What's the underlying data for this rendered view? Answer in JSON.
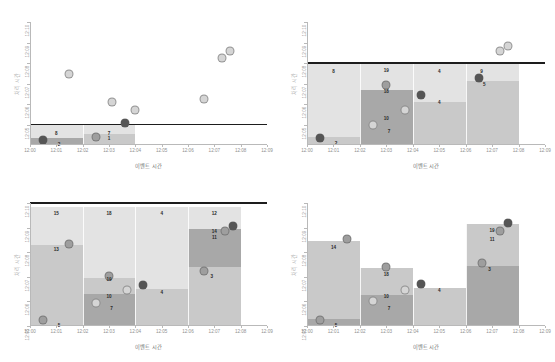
{
  "figure": {
    "panel_count": 4,
    "background": "#ffffff"
  },
  "axes": {
    "xlabel": "이벤트 시간",
    "ylabel": "처리 시간",
    "xticks": [
      "12:00",
      "12:01",
      "12:02",
      "12:03",
      "12:04",
      "12:05",
      "12:06",
      "12:07",
      "12:08",
      "12:09"
    ],
    "yticks": [
      "12:05",
      "12:06",
      "12:07",
      "12:08",
      "12:09",
      "12:10"
    ]
  },
  "colors": {
    "watermark_line": "#1d1d1d",
    "bar_light": "#e3e3e3",
    "bar_mid": "#c9c9c9",
    "bar_dark": "#a8a8a8",
    "marker_dark": "#555555",
    "marker_mid": "#9e9e9e",
    "marker_light": "#d5d5d5",
    "axis": "#b9b9b9",
    "tick_text": "#8f8f8f",
    "axis_label": "#6f6f6f"
  },
  "chart_data": [
    {
      "type": "scatter",
      "id": "panel-top-left",
      "title": "",
      "xlabel": "이벤트 시간",
      "ylabel": "처리 시간",
      "xlim": [
        "12:00",
        "12:09"
      ],
      "ylim": [
        "12:04",
        "12:10"
      ],
      "grid": false,
      "watermark": {
        "label": "watermark",
        "y": "12:05"
      },
      "bars": [
        {
          "x0": "12:00",
          "x1": "12:02",
          "segments": [
            {
              "y0": "12:04.00",
              "y1": "12:04.35",
              "shade": "dark"
            },
            {
              "y0": "12:04.35",
              "y1": "12:05.00",
              "shade": "light"
            }
          ]
        },
        {
          "x0": "12:02",
          "x1": "12:04",
          "segments": [
            {
              "y0": "12:04.00",
              "y1": "12:04.55",
              "shade": "mid"
            },
            {
              "y0": "12:04.55",
              "y1": "12:05.00",
              "shade": "light"
            }
          ]
        }
      ],
      "points": [
        {
          "label": "6",
          "x": "12:00.5",
          "y": "12:04.25",
          "tone": "dark"
        },
        {
          "label": "8",
          "x": "12:01.0",
          "y": "12:04.60",
          "tone": "none"
        },
        {
          "label": "2",
          "x": "12:01.1",
          "y": "12:04.05",
          "tone": "none"
        },
        {
          "label": "7",
          "x": "12:02.5",
          "y": "12:04.40",
          "tone": "mid"
        },
        {
          "label": "7",
          "x": "12:03.0",
          "y": "12:04.60",
          "tone": "none"
        },
        {
          "label": "1",
          "x": "12:03.0",
          "y": "12:04.35",
          "tone": "none"
        },
        {
          "label": "11",
          "x": "12:03.6",
          "y": "12:05.05",
          "tone": "dark"
        },
        {
          "label": "9",
          "x": "12:01.5",
          "y": "12:07.45",
          "tone": "light"
        },
        {
          "label": "10",
          "x": "12:03.1",
          "y": "12:06.10",
          "tone": "light"
        },
        {
          "label": "4",
          "x": "12:04.0",
          "y": "12:05.70",
          "tone": "light"
        },
        {
          "label": "3",
          "x": "12:06.6",
          "y": "12:06.25",
          "tone": "light"
        },
        {
          "label": "12",
          "x": "12:07.3",
          "y": "12:08.25",
          "tone": "light"
        },
        {
          "label": "5",
          "x": "12:07.6",
          "y": "12:08.60",
          "tone": "light"
        }
      ]
    },
    {
      "type": "scatter",
      "id": "panel-top-right",
      "title": "",
      "xlabel": "이벤트 시간",
      "ylabel": "처리 시간",
      "xlim": [
        "12:00",
        "12:09"
      ],
      "ylim": [
        "12:04",
        "12:10"
      ],
      "grid": false,
      "watermark": {
        "label": "watermark",
        "y": "12:08"
      },
      "bars": [
        {
          "x0": "12:00",
          "x1": "12:02",
          "segments": [
            {
              "y0": "12:04.00",
              "y1": "12:04.40",
              "shade": "mid"
            },
            {
              "y0": "12:04.40",
              "y1": "12:08.00",
              "shade": "light"
            }
          ]
        },
        {
          "x0": "12:02",
          "x1": "12:04",
          "segments": [
            {
              "y0": "12:04.00",
              "y1": "12:06.70",
              "shade": "dark"
            },
            {
              "y0": "12:06.70",
              "y1": "12:08.00",
              "shade": "light"
            }
          ]
        },
        {
          "x0": "12:04",
          "x1": "12:06",
          "segments": [
            {
              "y0": "12:04.00",
              "y1": "12:06.10",
              "shade": "mid"
            },
            {
              "y0": "12:06.10",
              "y1": "12:08.00",
              "shade": "light"
            }
          ]
        },
        {
          "x0": "12:06",
          "x1": "12:08",
          "segments": [
            {
              "y0": "12:04.00",
              "y1": "12:07.10",
              "shade": "mid"
            },
            {
              "y0": "12:07.10",
              "y1": "12:08.00",
              "shade": "light"
            }
          ]
        }
      ],
      "points": [
        {
          "label": "6",
          "x": "12:00.5",
          "y": "12:04.35",
          "tone": "dark"
        },
        {
          "label": "8",
          "x": "12:01.0",
          "y": "12:07.60",
          "tone": "none"
        },
        {
          "label": "2",
          "x": "12:01.1",
          "y": "12:04.10",
          "tone": "none"
        },
        {
          "label": "19",
          "x": "12:03.0",
          "y": "12:07.65",
          "tone": "none"
        },
        {
          "label": "16",
          "x": "12:03.0",
          "y": "12:06.95",
          "tone": "mid"
        },
        {
          "label": "18",
          "x": "12:03.0",
          "y": "12:06.65",
          "tone": "none"
        },
        {
          "label": "10",
          "x": "12:03.0",
          "y": "12:05.30",
          "tone": "none"
        },
        {
          "label": "7",
          "x": "12:03.1",
          "y": "12:04.70",
          "tone": "none"
        },
        {
          "label": "13",
          "x": "12:02.5",
          "y": "12:05.00",
          "tone": "light"
        },
        {
          "label": "17",
          "x": "12:03.7",
          "y": "12:05.70",
          "tone": "light"
        },
        {
          "label": "4",
          "x": "12:05.0",
          "y": "12:07.60",
          "tone": "none"
        },
        {
          "label": "14",
          "x": "12:04.3",
          "y": "12:06.45",
          "tone": "dark"
        },
        {
          "label": "4",
          "x": "12:05.0",
          "y": "12:06.10",
          "tone": "none"
        },
        {
          "label": "9",
          "x": "12:06.6",
          "y": "12:07.60",
          "tone": "none"
        },
        {
          "label": "5",
          "x": "12:06.7",
          "y": "12:07.00",
          "tone": "none"
        },
        {
          "label": "15",
          "x": "12:06.5",
          "y": "12:07.25",
          "tone": "dark"
        },
        {
          "label": "12",
          "x": "12:07.3",
          "y": "12:08.60",
          "tone": "light"
        },
        {
          "label": "3",
          "x": "12:07.6",
          "y": "12:08.85",
          "tone": "light"
        }
      ]
    },
    {
      "type": "bar",
      "id": "panel-bottom-left",
      "title": "",
      "xlabel": "이벤트 시간",
      "ylabel": "처리 시간",
      "xlim": [
        "12:00",
        "12:09"
      ],
      "ylim": [
        "12:05",
        "12:10"
      ],
      "grid": false,
      "watermark": {
        "label": "watermark",
        "y": "12:10"
      },
      "bars": [
        {
          "x0": "12:00",
          "x1": "12:02",
          "segments": [
            {
              "y0": "12:05.00",
              "y1": "12:08.30",
              "shade": "mid"
            },
            {
              "y0": "12:08.30",
              "y1": "12:09.85",
              "shade": "light"
            }
          ]
        },
        {
          "x0": "12:02",
          "x1": "12:04",
          "segments": [
            {
              "y0": "12:05.00",
              "y1": "12:06.30",
              "shade": "dark"
            },
            {
              "y0": "12:06.30",
              "y1": "12:06.95",
              "shade": "mid"
            },
            {
              "y0": "12:06.95",
              "y1": "12:09.85",
              "shade": "light"
            }
          ]
        },
        {
          "x0": "12:04",
          "x1": "12:06",
          "segments": [
            {
              "y0": "12:05.00",
              "y1": "12:06.50",
              "shade": "mid"
            },
            {
              "y0": "12:06.50",
              "y1": "12:09.85",
              "shade": "light"
            }
          ]
        },
        {
          "x0": "12:06",
          "x1": "12:08",
          "segments": [
            {
              "y0": "12:05.00",
              "y1": "12:07.40",
              "shade": "mid"
            },
            {
              "y0": "12:07.40",
              "y1": "12:08.95",
              "shade": "dark"
            },
            {
              "y0": "12:08.95",
              "y1": "12:09.85",
              "shade": "light"
            }
          ]
        }
      ],
      "points": [
        {
          "label": "15",
          "x": "12:01.0",
          "y": "12:09.60",
          "tone": "none"
        },
        {
          "label": "13",
          "x": "12:01.0",
          "y": "12:08.12",
          "tone": "none"
        },
        {
          "label": "9",
          "x": "12:01.5",
          "y": "12:08.35",
          "tone": "mid"
        },
        {
          "label": "1",
          "x": "12:00.5",
          "y": "12:05.25",
          "tone": "mid"
        },
        {
          "label": "5",
          "x": "12:01.1",
          "y": "12:05.05",
          "tone": "none"
        },
        {
          "label": "18",
          "x": "12:03.0",
          "y": "12:09.60",
          "tone": "none"
        },
        {
          "label": "16",
          "x": "12:03.0",
          "y": "12:07.05",
          "tone": "mid"
        },
        {
          "label": "19",
          "x": "12:03.0",
          "y": "12:06.90",
          "tone": "none"
        },
        {
          "label": "10",
          "x": "12:03.0",
          "y": "12:06.20",
          "tone": "none"
        },
        {
          "label": "7",
          "x": "12:03.1",
          "y": "12:05.75",
          "tone": "none"
        },
        {
          "label": "13",
          "x": "12:02.5",
          "y": "12:05.95",
          "tone": "light"
        },
        {
          "label": "17",
          "x": "12:03.7",
          "y": "12:06.45",
          "tone": "light"
        },
        {
          "label": "4",
          "x": "12:05.0",
          "y": "12:09.60",
          "tone": "none"
        },
        {
          "label": "14",
          "x": "12:04.3",
          "y": "12:06.65",
          "tone": "dark"
        },
        {
          "label": "4",
          "x": "12:05.0",
          "y": "12:06.40",
          "tone": "none"
        },
        {
          "label": "12",
          "x": "12:07.0",
          "y": "12:09.60",
          "tone": "none"
        },
        {
          "label": "14",
          "x": "12:07.0",
          "y": "12:08.85",
          "tone": "none"
        },
        {
          "label": "11",
          "x": "12:07.0",
          "y": "12:08.62",
          "tone": "none"
        },
        {
          "label": "15",
          "x": "12:07.4",
          "y": "12:08.85",
          "tone": "mid"
        },
        {
          "label": "20",
          "x": "12:07.7",
          "y": "12:09.05",
          "tone": "dark"
        },
        {
          "label": "8",
          "x": "12:06.6",
          "y": "12:07.25",
          "tone": "mid"
        },
        {
          "label": "3",
          "x": "12:06.9",
          "y": "12:07.05",
          "tone": "none"
        }
      ]
    },
    {
      "type": "bar",
      "id": "panel-bottom-right",
      "title": "",
      "xlabel": "이벤트 시간",
      "ylabel": "처리 시간",
      "xlim": [
        "12:00",
        "12:09"
      ],
      "ylim": [
        "12:05",
        "12:10"
      ],
      "grid": false,
      "watermark": null,
      "bars": [
        {
          "x0": "12:00",
          "x1": "12:02",
          "segments": [
            {
              "y0": "12:05.00",
              "y1": "12:05.30",
              "shade": "dark"
            },
            {
              "y0": "12:05.30",
              "y1": "12:08.45",
              "shade": "mid"
            }
          ]
        },
        {
          "x0": "12:02",
          "x1": "12:04",
          "segments": [
            {
              "y0": "12:05.00",
              "y1": "12:06.25",
              "shade": "dark"
            },
            {
              "y0": "12:06.25",
              "y1": "12:07.35",
              "shade": "mid"
            }
          ]
        },
        {
          "x0": "12:04",
          "x1": "12:06",
          "segments": [
            {
              "y0": "12:05.00",
              "y1": "12:06.55",
              "shade": "mid"
            }
          ]
        },
        {
          "x0": "12:06",
          "x1": "12:08",
          "segments": [
            {
              "y0": "12:05.00",
              "y1": "12:07.45",
              "shade": "dark"
            },
            {
              "y0": "12:07.45",
              "y1": "12:09.15",
              "shade": "mid"
            }
          ]
        }
      ],
      "points": [
        {
          "label": "9",
          "x": "12:01.5",
          "y": "12:08.55",
          "tone": "mid"
        },
        {
          "label": "14",
          "x": "12:01.0",
          "y": "12:08.20",
          "tone": "none"
        },
        {
          "label": "1",
          "x": "12:00.5",
          "y": "12:05.25",
          "tone": "mid"
        },
        {
          "label": "5",
          "x": "12:01.1",
          "y": "12:05.05",
          "tone": "none"
        },
        {
          "label": "16",
          "x": "12:03.0",
          "y": "12:07.40",
          "tone": "mid"
        },
        {
          "label": "18",
          "x": "12:03.0",
          "y": "12:07.10",
          "tone": "none"
        },
        {
          "label": "10",
          "x": "12:03.0",
          "y": "12:06.20",
          "tone": "none"
        },
        {
          "label": "7",
          "x": "12:03.1",
          "y": "12:05.75",
          "tone": "none"
        },
        {
          "label": "13",
          "x": "12:02.5",
          "y": "12:06.00",
          "tone": "light"
        },
        {
          "label": "17",
          "x": "12:03.7",
          "y": "12:06.45",
          "tone": "light"
        },
        {
          "label": "14",
          "x": "12:04.3",
          "y": "12:06.70",
          "tone": "dark"
        },
        {
          "label": "4",
          "x": "12:05.0",
          "y": "12:06.45",
          "tone": "none"
        },
        {
          "label": "20",
          "x": "12:07.6",
          "y": "12:09.20",
          "tone": "dark"
        },
        {
          "label": "15",
          "x": "12:07.3",
          "y": "12:08.85",
          "tone": "mid"
        },
        {
          "label": "19",
          "x": "12:07.0",
          "y": "12:08.90",
          "tone": "none"
        },
        {
          "label": "11",
          "x": "12:07.0",
          "y": "12:08.55",
          "tone": "none"
        },
        {
          "label": "8",
          "x": "12:06.6",
          "y": "12:07.55",
          "tone": "mid"
        },
        {
          "label": "3",
          "x": "12:06.9",
          "y": "12:07.30",
          "tone": "none"
        }
      ]
    }
  ]
}
